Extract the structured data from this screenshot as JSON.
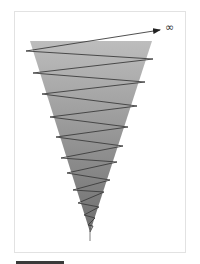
{
  "diagram": {
    "type": "spiral-cone",
    "infinity_label": "∞",
    "colors": {
      "cone_top": "#bdbdbd",
      "cone_bottom": "#6e6e6e",
      "line": "#3c3c3c",
      "frame_border": "#e2e2e2",
      "bar": "#3a3a3a"
    },
    "cone": {
      "top_left": [
        30,
        41
      ],
      "top_right": [
        152,
        41
      ],
      "apex": [
        90,
        232
      ]
    },
    "arrow": {
      "from": [
        26,
        51
      ],
      "to": [
        160,
        30
      ]
    },
    "zigzag_points": [
      [
        26,
        51
      ],
      [
        153,
        59
      ],
      [
        33,
        73
      ],
      [
        145,
        82
      ],
      [
        42,
        94
      ],
      [
        137,
        106
      ],
      [
        50,
        117
      ],
      [
        128,
        127
      ],
      [
        56,
        137
      ],
      [
        123,
        146
      ],
      [
        61,
        158
      ],
      [
        117,
        162
      ],
      [
        67,
        173
      ],
      [
        110,
        180
      ],
      [
        73,
        190
      ],
      [
        104,
        192
      ],
      [
        78,
        203
      ],
      [
        99,
        207
      ],
      [
        84,
        215
      ],
      [
        95,
        218
      ],
      [
        88,
        225
      ],
      [
        93,
        226
      ],
      [
        90,
        232
      ]
    ],
    "stem": {
      "from": [
        90,
        228
      ],
      "to": [
        90,
        241
      ]
    }
  }
}
